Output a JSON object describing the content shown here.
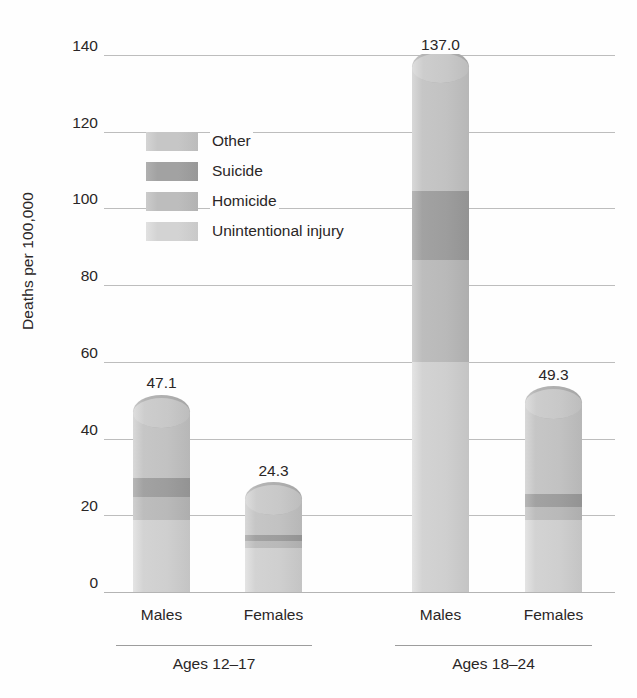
{
  "chart_data": {
    "type": "bar",
    "subtype": "stacked-column",
    "title": "",
    "xlabel": "",
    "ylabel": "Deaths per 100,000",
    "ylim": [
      0,
      140
    ],
    "ytick_step": 20,
    "yticks": [
      140,
      120,
      100,
      80,
      60,
      40,
      20,
      0
    ],
    "ytick_labels": [
      "140",
      "120",
      "100",
      "80",
      "60",
      "40",
      "20",
      "0"
    ],
    "grid": true,
    "legend_position": "inside-upper-left",
    "categories": [
      "Males",
      "Females",
      "Males",
      "Females"
    ],
    "groups": [
      {
        "label": "Ages 12–17",
        "categories": [
          "Males",
          "Females"
        ]
      },
      {
        "label": "Ages 18–24",
        "categories": [
          "Males",
          "Females"
        ]
      }
    ],
    "series": [
      {
        "name": "Unintentional injury",
        "color": "#d3d3d3",
        "values": [
          18.8,
          11.5,
          60.0,
          18.8
        ]
      },
      {
        "name": "Homicide",
        "color": "#bdbdbd",
        "values": [
          6.0,
          1.8,
          26.6,
          3.4
        ]
      },
      {
        "name": "Suicide",
        "color": "#a2a2a2",
        "values": [
          5.0,
          1.5,
          18.0,
          3.4
        ]
      },
      {
        "name": "Other",
        "color": "#c6c6c6",
        "values": [
          17.3,
          9.5,
          32.4,
          23.7
        ]
      }
    ],
    "totals": [
      47.1,
      24.3,
      137.0,
      49.3
    ],
    "total_labels": [
      "47.1",
      "24.3",
      "137.0",
      "49.3"
    ],
    "legend_entries": [
      {
        "label": "Other",
        "color": "#c6c6c6"
      },
      {
        "label": "Suicide",
        "color": "#a2a2a2"
      },
      {
        "label": "Homicide",
        "color": "#bdbdbd"
      },
      {
        "label": "Unintentional injury",
        "color": "#d3d3d3"
      }
    ]
  },
  "axis": {
    "y_title": "Deaths per 100,000"
  },
  "colors": {
    "background": "#fefefe",
    "gridline": "#bdbdbd",
    "text": "#2a2626",
    "group_rule": "#9d9d9d"
  }
}
